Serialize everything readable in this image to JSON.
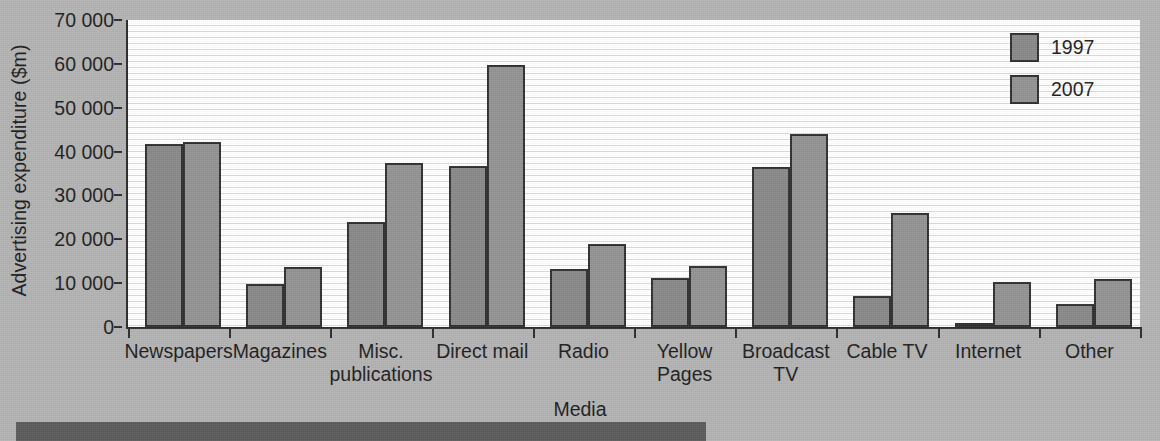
{
  "chart_data": {
    "type": "bar",
    "title": "",
    "xlabel": "Media",
    "ylabel": "Advertising expenditure ($m)",
    "ylim": [
      0,
      70000
    ],
    "ytick_labels": [
      "0",
      "10000",
      "20000",
      "30000",
      "40000",
      "50000",
      "60000",
      "70000"
    ],
    "ytick_values": [
      0,
      10000,
      20000,
      30000,
      40000,
      50000,
      60000,
      70000
    ],
    "grid": true,
    "legend_position": "top-right",
    "categories": [
      "Newspapers",
      "Magazines",
      "Misc.\npublications",
      "Direct mail",
      "Radio",
      "Yellow\nPages",
      "Broadcast\nTV",
      "Cable TV",
      "Internet",
      "Other"
    ],
    "series": [
      {
        "name": "1997",
        "color": "#888888",
        "values": [
          41800,
          9800,
          24000,
          36700,
          13300,
          11200,
          36500,
          7000,
          900,
          5200
        ]
      },
      {
        "name": "2007",
        "color": "#929292",
        "values": [
          42200,
          13700,
          37300,
          59800,
          19000,
          14000,
          44000,
          25900,
          10200,
          11000
        ]
      }
    ]
  },
  "legend": {
    "items": [
      {
        "label": "1997",
        "color": "#888888"
      },
      {
        "label": "2007",
        "color": "#929292"
      }
    ]
  },
  "colors": {
    "figure_background": "#b2b2b2",
    "plot_background": "#fdfdfd",
    "axis": "#2b2b2b",
    "gridline": "#dcdcdc",
    "bar_edge": "#2e2e2e",
    "series_1997": "#888888",
    "series_2007": "#929292",
    "bottom_bar": "#5a5a5a"
  }
}
